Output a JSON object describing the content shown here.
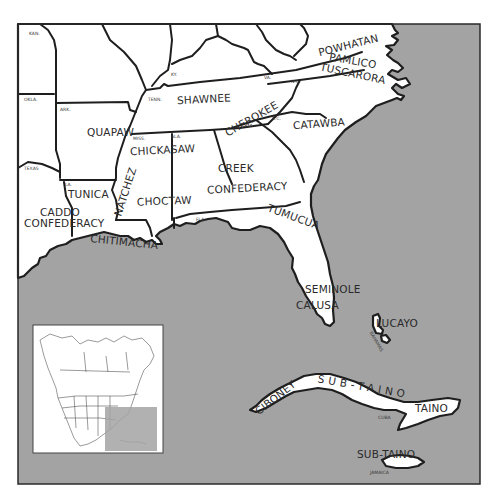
{
  "map": {
    "colors": {
      "sea": "#a3a3a3",
      "land": "#ffffff",
      "line": "#1e1e1e"
    },
    "state_labels": {
      "kan": "KAN.",
      "okla": "OKLA.",
      "ark": "ARK.",
      "texas": "TEXAS",
      "la": "LA.",
      "ky": "KY.",
      "tenn": "TENN.",
      "va": "VA.",
      "nc": "N.C.",
      "sc": "S.C.",
      "ga": "GA.",
      "miss": "MISS.",
      "ala": "ALA.",
      "fla": "FLA.",
      "bahamas": "BAHAMAS",
      "cuba": "CUBA",
      "jamaica": "JAMAICA"
    },
    "tribes": {
      "powhatan": "POWHATAN",
      "pamlico": "PAMLICO",
      "tuscarora": "TUSCARORA",
      "shawnee": "SHAWNEE",
      "cherokee": "CHEROKEE",
      "catawba": "CATAWBA",
      "quapaw": "QUAPAW",
      "chickasaw": "CHICKASAW",
      "creek_1": "CREEK",
      "creek_2": "CONFEDERACY",
      "tunica": "TUNICA",
      "natchez": "NATCHEZ",
      "choctaw": "CHOCTAW",
      "caddo_1": "CADDO",
      "caddo_2": "CONFEDERACY",
      "chitimacha": "CHITIMACHA",
      "tumucua": "TUMUCUA",
      "seminole": "SEMINOLE",
      "calusa": "CALUSA",
      "lucayo": "LUCAYO",
      "ciboney": "CIBONEY",
      "sub_taino_cuba": "SUB-TAINO",
      "taino": "TAINO",
      "sub_taino_jamaica": "SUB-TAINO"
    },
    "inset": {
      "caption": "North America locator",
      "highlight": "Southeastern United States and Caribbean"
    }
  }
}
